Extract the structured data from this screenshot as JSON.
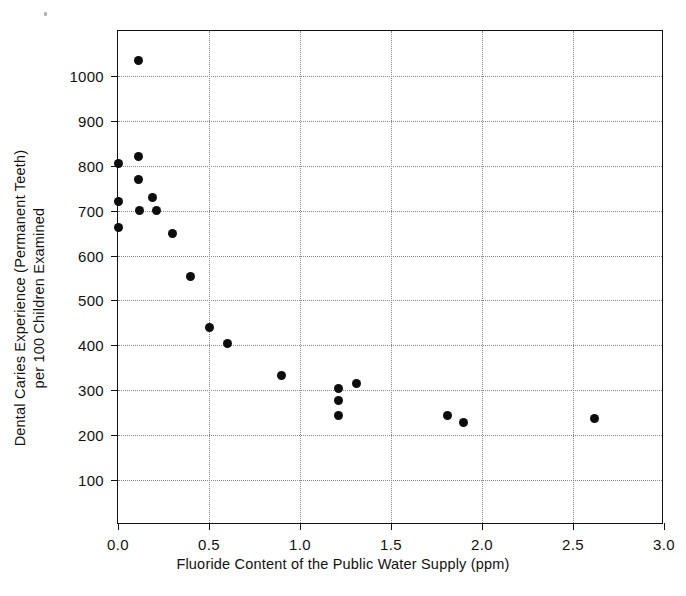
{
  "chart_data": {
    "type": "scatter",
    "title": "",
    "xlabel": "Fluoride Content of the Public Water Supply (ppm)",
    "ylabel_line1": "Dental Caries Experience (Permanent Teeth)",
    "ylabel_line2": "per 100 Children Examined",
    "xlim": [
      0.0,
      3.0
    ],
    "ylim": [
      0,
      1100
    ],
    "xticks": [
      0.0,
      0.5,
      1.0,
      1.5,
      2.0,
      2.5,
      3.0
    ],
    "xticklabels": [
      "0.0",
      "0.5",
      "1.0",
      "1.5",
      "2.0",
      "2.5",
      "3.0"
    ],
    "yticks": [
      100,
      200,
      300,
      400,
      500,
      600,
      700,
      800,
      900,
      1000
    ],
    "yticklabels": [
      "100",
      "200",
      "300",
      "400",
      "500",
      "600",
      "700",
      "800",
      "900",
      "1000"
    ],
    "grid": true,
    "legend": "none",
    "marker": "filled-circle",
    "marker_color": "#0d0d0d",
    "points": [
      {
        "x": 0.0,
        "y": 805
      },
      {
        "x": 0.0,
        "y": 720
      },
      {
        "x": 0.0,
        "y": 663
      },
      {
        "x": 0.11,
        "y": 1035
      },
      {
        "x": 0.11,
        "y": 820
      },
      {
        "x": 0.11,
        "y": 770
      },
      {
        "x": 0.12,
        "y": 700
      },
      {
        "x": 0.19,
        "y": 730
      },
      {
        "x": 0.21,
        "y": 700
      },
      {
        "x": 0.3,
        "y": 650
      },
      {
        "x": 0.4,
        "y": 553
      },
      {
        "x": 0.5,
        "y": 440
      },
      {
        "x": 0.6,
        "y": 405
      },
      {
        "x": 0.9,
        "y": 334
      },
      {
        "x": 1.21,
        "y": 303
      },
      {
        "x": 1.21,
        "y": 278
      },
      {
        "x": 1.21,
        "y": 243
      },
      {
        "x": 1.31,
        "y": 315
      },
      {
        "x": 1.81,
        "y": 243
      },
      {
        "x": 1.9,
        "y": 228
      },
      {
        "x": 2.62,
        "y": 237
      }
    ]
  }
}
